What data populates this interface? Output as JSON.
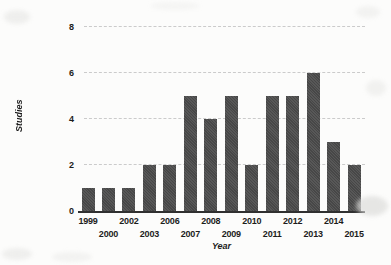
{
  "chart_data": {
    "type": "bar",
    "title": "",
    "xlabel": "Year",
    "ylabel": "Studies",
    "categories": [
      "1999",
      "2000",
      "2002",
      "2003",
      "2006",
      "2007",
      "2008",
      "2009",
      "2010",
      "2011",
      "2012",
      "2013",
      "2014",
      "2015"
    ],
    "values": [
      1,
      1,
      1,
      2,
      2,
      5,
      4,
      5,
      2,
      5,
      5,
      6,
      3,
      2
    ],
    "y_ticks": [
      0,
      2,
      4,
      6,
      8
    ],
    "ylim": [
      0,
      8
    ],
    "grid": "horizontal-dashed",
    "legend": "none",
    "bar_color": "#4b4b4b",
    "gridline_color": "#cbcbcb",
    "axis_color": "#303030",
    "text_color": "#1c1c1c",
    "x_label_layout": "staggered-two-rows"
  }
}
